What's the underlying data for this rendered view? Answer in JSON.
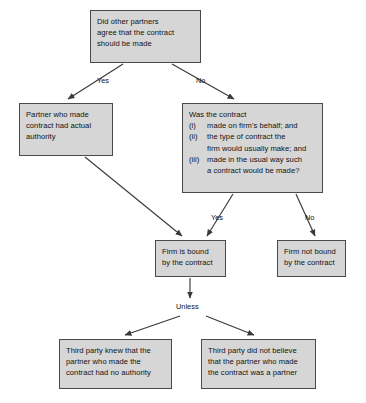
{
  "diagram": {
    "box_fill": "#d6d6d6",
    "box_border": "#4a4a4a",
    "arrow_color": "#3a3a3a",
    "background": "#ffffff"
  },
  "nodes": {
    "question_top": {
      "lines": [
        "Did other partners",
        "agree that the contract",
        "should be made"
      ]
    },
    "actual_authority": {
      "lines": [
        "Partner who made",
        "contract had actual",
        "authority"
      ]
    },
    "contract_test": {
      "heading": "Was the contract",
      "items": [
        {
          "marker": "(i)",
          "lines": [
            "made on firm's behalf; and"
          ]
        },
        {
          "marker": "(ii)",
          "lines": [
            "the type of contract the",
            "firm would usually make; and"
          ]
        },
        {
          "marker": "(iii)",
          "lines": [
            "made in the usual way such",
            "a contract would be made?"
          ]
        }
      ]
    },
    "firm_bound": {
      "lines": [
        "Firm is bound",
        "by the contract"
      ]
    },
    "firm_not_bound": {
      "lines": [
        "Firm not bound",
        "by the contract"
      ]
    },
    "third_party_knew": {
      "lines": [
        "Third party knew that the",
        "partner who made the",
        "contract had no authority"
      ]
    },
    "third_party_not_believe": {
      "lines": [
        "Third party did not believe",
        "that the partner who made",
        "the contract was a partner"
      ]
    }
  },
  "edge_labels": {
    "yes_top": "Yes",
    "no_top": "No",
    "yes_mid": "Yes",
    "no_mid": "No",
    "unless": "Unless"
  }
}
